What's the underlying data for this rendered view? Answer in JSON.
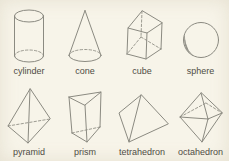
{
  "colors": {
    "background": "#f7f4e9",
    "line": "#8b8a81",
    "text": "#4f4c44"
  },
  "shapes": [
    {
      "label": "cylinder"
    },
    {
      "label": "cone"
    },
    {
      "label": "cube"
    },
    {
      "label": "sphere"
    },
    {
      "label": "pyramid"
    },
    {
      "label": "prism"
    },
    {
      "label": "tetrahedron"
    },
    {
      "label": "octahedron"
    }
  ]
}
